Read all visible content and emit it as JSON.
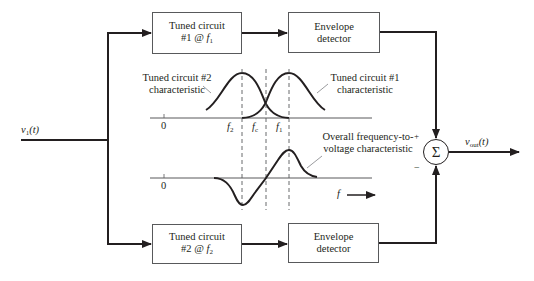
{
  "input": {
    "signal": "v",
    "subscript": "1",
    "arg": "(t)"
  },
  "output": {
    "signal": "v",
    "subscript": "out",
    "arg": "(t)"
  },
  "blocks": {
    "tuned1": {
      "line1": "Tuned circuit",
      "line2_prefix": "#1 @ ",
      "freq": "f",
      "freq_sub": "1"
    },
    "env1": {
      "line1": "Envelope",
      "line2": "detector"
    },
    "tuned2": {
      "line1": "Tuned circuit",
      "line2_prefix": "#2 @ ",
      "freq": "f",
      "freq_sub": "2"
    },
    "env2": {
      "line1": "Envelope",
      "line2": "detector"
    }
  },
  "summer": {
    "symbol": "Σ",
    "plus": "+",
    "minus": "−"
  },
  "plots": {
    "top": {
      "origin": "0",
      "label_tc2": [
        "Tuned circuit #2",
        "characteristic"
      ],
      "label_tc1": [
        "Tuned circuit #1",
        "characteristic"
      ],
      "ticks": [
        {
          "name": "f",
          "sub": "2"
        },
        {
          "name": "f",
          "sub": "c"
        },
        {
          "name": "f",
          "sub": "1"
        }
      ]
    },
    "bottom": {
      "origin": "0",
      "label": [
        "Overall frequency-to-",
        "voltage characteristic"
      ],
      "axis_label": "f"
    }
  },
  "colors": {
    "line": "#231f20",
    "box_border": "#58595b",
    "leader": "#808285"
  }
}
